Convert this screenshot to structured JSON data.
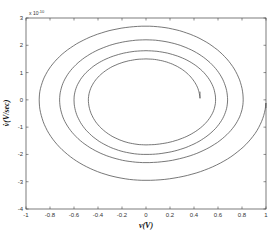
{
  "chart_data": {
    "type": "line",
    "title": "",
    "xlabel": "v(V)",
    "ylabel": "v̇(V/sec)",
    "y_multiplier": "x 10^-10",
    "y_multiplier_base": "x 10",
    "y_multiplier_exp": "-10",
    "xlim": [
      -1,
      1
    ],
    "ylim": [
      -4,
      3
    ],
    "grid": false,
    "legend": null,
    "x_ticks": [
      "-1",
      "-0.8",
      "-0.6",
      "-0.4",
      "-0.2",
      "0",
      "0.2",
      "0.4",
      "0.6",
      "0.8",
      "1"
    ],
    "y_ticks": [
      "3",
      "2",
      "1",
      "0",
      "-1",
      "-2",
      "-3",
      "-4"
    ],
    "series": [
      {
        "name": "phase-portrait-spiral",
        "color": "#555555",
        "description": "Clockwise decaying spiral starting at (1, -0.3) and ending near (0.45, 0.3)",
        "extrema": {
          "right": [
            1.0,
            0.81,
            0.68,
            0.58,
            0.45
          ],
          "bottom": [
            -2.95,
            -2.3,
            -2.0,
            -1.65
          ],
          "left": [
            -0.89,
            -0.72,
            -0.6,
            -0.48
          ],
          "top": [
            2.7,
            2.2,
            1.8,
            1.5
          ]
        },
        "start": [
          1.0,
          -0.3
        ],
        "end": [
          0.45,
          0.3
        ]
      }
    ]
  }
}
